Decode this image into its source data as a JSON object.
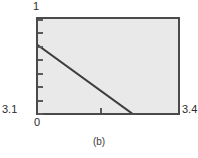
{
  "figure": {
    "caption": "(b)"
  },
  "chart_data": {
    "type": "line",
    "title": "",
    "xlabel": "",
    "ylabel": "",
    "xlim": [
      0,
      3.4
    ],
    "ylim": [
      3.1,
      1
    ],
    "x_tick_labels": [
      "0",
      "3.4"
    ],
    "y_tick_labels": [
      "1",
      "3.1"
    ],
    "y_axis_top_label": "1",
    "y_axis_bottom_label": "3.1",
    "x_axis_left_label": "0",
    "x_axis_right_label": "3.4",
    "grid": false,
    "legend": null,
    "axis_inverted_y": true,
    "series": [
      {
        "name": "curve",
        "x": [
          0.0,
          2.27
        ],
        "y": [
          1.63,
          3.1
        ],
        "x_frac": [
          0.0,
          0.667
        ],
        "y_frac": [
          0.28,
          1.0
        ],
        "color": "#3c3c3c",
        "width": 2
      }
    ],
    "y_tick_fracs": [
      0.0,
      0.143,
      0.286,
      0.429,
      0.571,
      0.714,
      0.857,
      1.0
    ],
    "x_tick_fracs": [
      0.44
    ],
    "plot_bg_color": "#e9e9e9",
    "frame_color": "#4a4a4a"
  }
}
